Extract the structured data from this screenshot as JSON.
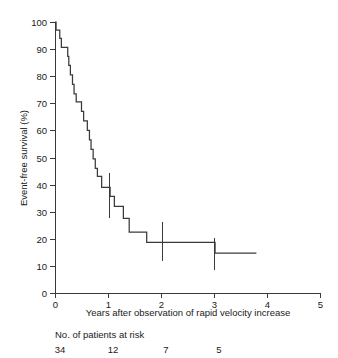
{
  "chart_data": {
    "type": "line",
    "subtype": "kaplan-meier-step",
    "title": "",
    "xlabel": "Years after observation of rapid velocity increase",
    "ylabel": "Event-free survival (%)",
    "xlim": [
      0,
      5
    ],
    "ylim": [
      0,
      100
    ],
    "xticks": [
      0,
      1,
      2,
      3,
      4,
      5
    ],
    "xtick_labels": [
      "0",
      "1",
      "2",
      "3",
      "4",
      "5"
    ],
    "yticks": [
      0,
      10,
      20,
      30,
      40,
      50,
      60,
      70,
      80,
      90,
      100
    ],
    "ytick_labels": [
      "0",
      "10",
      "20",
      "30",
      "40",
      "50",
      "60",
      "70",
      "80",
      "90",
      "100"
    ],
    "grid": false,
    "legend": null,
    "series": [
      {
        "name": "Event-free survival",
        "color": "#3a3a3a",
        "step": "post",
        "points": [
          {
            "x": 0.0,
            "y": 100.0
          },
          {
            "x": 0.02,
            "y": 97.0
          },
          {
            "x": 0.09,
            "y": 94.0
          },
          {
            "x": 0.12,
            "y": 90.6
          },
          {
            "x": 0.22,
            "y": 90.6
          },
          {
            "x": 0.24,
            "y": 87.3
          },
          {
            "x": 0.26,
            "y": 84.0
          },
          {
            "x": 0.29,
            "y": 80.5
          },
          {
            "x": 0.33,
            "y": 77.0
          },
          {
            "x": 0.36,
            "y": 73.5
          },
          {
            "x": 0.4,
            "y": 70.5
          },
          {
            "x": 0.47,
            "y": 70.5
          },
          {
            "x": 0.5,
            "y": 67.0
          },
          {
            "x": 0.54,
            "y": 63.5
          },
          {
            "x": 0.58,
            "y": 63.5
          },
          {
            "x": 0.61,
            "y": 60.0
          },
          {
            "x": 0.65,
            "y": 56.5
          },
          {
            "x": 0.68,
            "y": 53.0
          },
          {
            "x": 0.72,
            "y": 49.5
          },
          {
            "x": 0.76,
            "y": 46.0
          },
          {
            "x": 0.8,
            "y": 43.0
          },
          {
            "x": 0.86,
            "y": 43.0
          },
          {
            "x": 0.88,
            "y": 39.0
          },
          {
            "x": 1.02,
            "y": 39.0
          },
          {
            "x": 1.04,
            "y": 35.7
          },
          {
            "x": 1.1,
            "y": 35.7
          },
          {
            "x": 1.12,
            "y": 32.0
          },
          {
            "x": 1.26,
            "y": 32.0
          },
          {
            "x": 1.29,
            "y": 27.5
          },
          {
            "x": 1.37,
            "y": 27.5
          },
          {
            "x": 1.4,
            "y": 22.5
          },
          {
            "x": 1.71,
            "y": 22.5
          },
          {
            "x": 1.73,
            "y": 18.7
          },
          {
            "x": 3.0,
            "y": 18.7
          },
          {
            "x": 3.02,
            "y": 14.7
          },
          {
            "x": 3.8,
            "y": 14.7
          }
        ]
      }
    ],
    "error_bars": [
      {
        "x": 1.02,
        "y": 35.7,
        "low": 27.5,
        "high": 44.2
      },
      {
        "x": 2.02,
        "y": 18.7,
        "low": 11.8,
        "high": 26.3
      },
      {
        "x": 3.0,
        "y": 16.5,
        "low": 8.5,
        "high": 20.2
      }
    ],
    "risk_table": {
      "title": "No. of patients at risk",
      "times": [
        0,
        1,
        2,
        3
      ],
      "counts": [
        "34",
        "12",
        "7",
        "5"
      ]
    }
  }
}
